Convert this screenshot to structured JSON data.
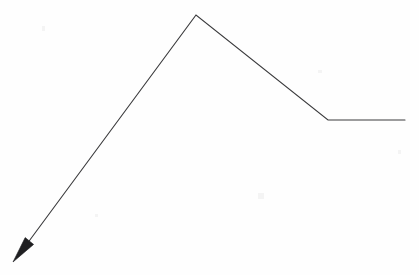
{
  "document": {
    "title": "Arrow polyline sketch",
    "width": 419,
    "height": 275,
    "background_color": "#fefefe"
  },
  "style": {
    "stroke_color": "#3a3a3c",
    "stroke_width": 1.1,
    "arrowhead_fill": "#1f1f21",
    "line_cap": "round",
    "line_join": "miter"
  },
  "chart_data": {
    "type": "line",
    "title": "",
    "subtitle": "",
    "xlabel": "",
    "ylabel": "",
    "grid": false,
    "legend": null,
    "axes_visible": false,
    "tick_labels_x": [],
    "tick_labels_y": [],
    "xlim": [
      0,
      419
    ],
    "ylim": [
      275,
      0
    ],
    "series": [
      {
        "name": "polyline",
        "points": [
          [
            13,
            262
          ],
          [
            196,
            15
          ],
          [
            328,
            120
          ],
          [
            405,
            120
          ]
        ],
        "segments": [
          {
            "name": "ascending-segment",
            "from": [
              13,
              262
            ],
            "to": [
              196,
              15
            ]
          },
          {
            "name": "descending-segment",
            "from": [
              196,
              15
            ],
            "to": [
              328,
              120
            ]
          },
          {
            "name": "plateau-segment",
            "from": [
              328,
              120
            ],
            "to": [
              405,
              120
            ]
          }
        ]
      }
    ],
    "markers": [
      {
        "name": "arrowhead",
        "shape": "filled-triangle",
        "tip": [
          13,
          262
        ],
        "base_center": [
          29,
          241
        ],
        "half_width": 3.6,
        "direction": "down-left"
      }
    ],
    "annotations": []
  },
  "paths": {
    "polyline_d": "M 29.5 240.5 L 196 15 L 328 120 L 405 120",
    "arrowhead_d": "M 13 262 L 25.2 237.6 L 33.6 244.4 Z",
    "shaft_tail_d": "M 29.5 240.5 L 26.5 245.5"
  },
  "specks": [
    {
      "name": "speck-top-left",
      "x": 42,
      "y": 26,
      "w": 3,
      "h": 5
    },
    {
      "name": "speck-mid",
      "x": 258,
      "y": 193,
      "w": 6,
      "h": 6
    },
    {
      "name": "speck-upper-right",
      "x": 318,
      "y": 70,
      "w": 4,
      "h": 3
    },
    {
      "name": "speck-lower-left",
      "x": 95,
      "y": 214,
      "w": 3,
      "h": 3
    },
    {
      "name": "speck-right",
      "x": 398,
      "y": 150,
      "w": 3,
      "h": 4
    }
  ]
}
